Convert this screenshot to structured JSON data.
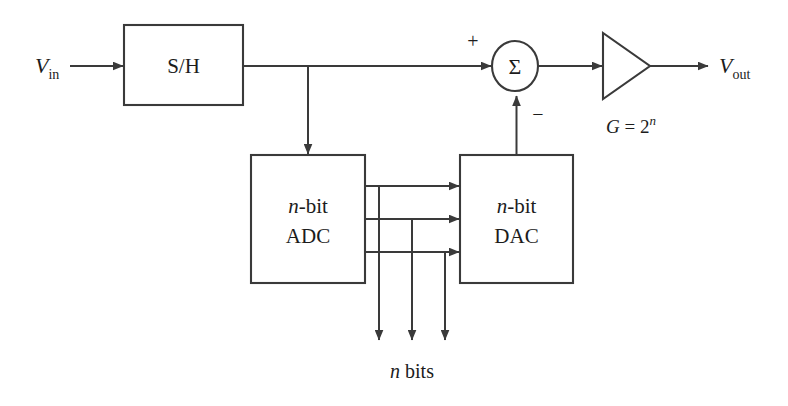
{
  "diagram": {
    "background_color": "#ffffff",
    "line_color": "#3a3a3a",
    "text_color": "#1c1c1c"
  },
  "labels": {
    "v_in_symbol": "V",
    "v_in_subscript": "in",
    "v_out_symbol": "V",
    "v_out_subscript": "out",
    "sample_hold": "S/H",
    "adc_line1_italic": "n",
    "adc_line1_rest": "-bit",
    "adc_line2": "ADC",
    "dac_line1_italic": "n",
    "dac_line1_rest": "-bit",
    "dac_line2": "DAC",
    "summer_symbol": "Σ",
    "plus_sign": "+",
    "minus_sign": "−",
    "gain_prefix": "G",
    "gain_equals": " = 2",
    "gain_exponent": "n",
    "n_bits_italic": "n",
    "n_bits_rest": " bits"
  },
  "blocks": [
    {
      "name": "sample-hold-block",
      "label": "S/H",
      "x": 124,
      "y": 25,
      "w": 119,
      "h": 80
    },
    {
      "name": "adc-block",
      "label": "n-bit ADC",
      "x": 251,
      "y": 155,
      "w": 114,
      "h": 128
    },
    {
      "name": "dac-block",
      "label": "n-bit DAC",
      "x": 460,
      "y": 155,
      "w": 113,
      "h": 128
    }
  ],
  "summing_junction": {
    "name": "summing-junction",
    "cx": 515,
    "cy": 66,
    "rx": 23,
    "ry": 25
  },
  "amplifier": {
    "name": "gain-amplifier",
    "x1": 603,
    "y1": 33,
    "x2": 603,
    "y2": 99,
    "apex_x": 650,
    "apex_y": 66,
    "gain_label": "G = 2ⁿ"
  },
  "signal_paths": [
    {
      "name": "vin-to-sh",
      "from": "V_in",
      "to": "S/H"
    },
    {
      "name": "sh-to-summer",
      "from": "S/H",
      "to": "summing-junction-plus"
    },
    {
      "name": "sh-branch-to-adc",
      "from": "S/H",
      "to": "ADC"
    },
    {
      "name": "adc-bit0-to-dac",
      "from": "ADC",
      "to": "DAC"
    },
    {
      "name": "adc-bit1-to-dac",
      "from": "ADC",
      "to": "DAC"
    },
    {
      "name": "adc-bit2-to-dac",
      "from": "ADC",
      "to": "DAC"
    },
    {
      "name": "dac-to-summer-minus",
      "from": "DAC",
      "to": "summing-junction-minus"
    },
    {
      "name": "summer-to-amplifier",
      "from": "summing-junction",
      "to": "amplifier"
    },
    {
      "name": "amplifier-to-vout",
      "from": "amplifier",
      "to": "V_out"
    },
    {
      "name": "bit-tap-0-down",
      "from": "ADC",
      "to": "n bits"
    },
    {
      "name": "bit-tap-1-down",
      "from": "ADC",
      "to": "n bits"
    },
    {
      "name": "bit-tap-2-down",
      "from": "ADC",
      "to": "n bits"
    }
  ],
  "bit_count_display": 3
}
